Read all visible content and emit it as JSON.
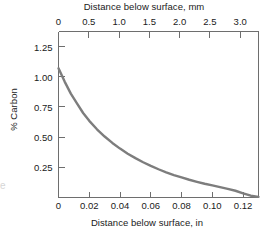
{
  "chart_data": {
    "type": "line",
    "title": "",
    "xlabel": "Distance below surface, in",
    "ylabel": "% Carbon",
    "xlabel_top": "Distance below surface, mm",
    "xlim": [
      0,
      0.13
    ],
    "xlim_top": [
      0,
      3.302
    ],
    "ylim": [
      0,
      1.375
    ],
    "grid": false,
    "legend": null,
    "curve_color": "#7d7d7d",
    "axis_color": "#6e6e6e",
    "xticks_bottom": [
      "0",
      "0.02",
      "0.04",
      "0.06",
      "0.08",
      "0.10",
      "0.12"
    ],
    "xtick_values_bottom": [
      0,
      0.02,
      0.04,
      0.06,
      0.08,
      0.1,
      0.12
    ],
    "xticks_top": [
      "0",
      "0.5",
      "1.0",
      "1.5",
      "2.0",
      "2.5",
      "3.0"
    ],
    "xtick_values_top": [
      0,
      0.5,
      1.0,
      1.5,
      2.0,
      2.5,
      3.0
    ],
    "yticks": [
      "0.25",
      "0.50",
      "0.75",
      "1.00",
      "1.25"
    ],
    "ytick_values": [
      0.25,
      0.5,
      0.75,
      1.0,
      1.25
    ],
    "series": [
      {
        "name": "Carbon concentration profile",
        "x": [
          0,
          0.004,
          0.008,
          0.012,
          0.016,
          0.02,
          0.025,
          0.03,
          0.035,
          0.04,
          0.045,
          0.05,
          0.055,
          0.06,
          0.065,
          0.07,
          0.075,
          0.08,
          0.085,
          0.09,
          0.095,
          0.1,
          0.105,
          0.11,
          0.115,
          0.12,
          0.125,
          0.13
        ],
        "values": [
          1.07,
          0.96,
          0.86,
          0.78,
          0.7,
          0.635,
          0.565,
          0.505,
          0.452,
          0.405,
          0.363,
          0.326,
          0.292,
          0.262,
          0.234,
          0.209,
          0.186,
          0.166,
          0.147,
          0.13,
          0.114,
          0.1,
          0.086,
          0.072,
          0.056,
          0.035,
          0.015,
          0.005
        ]
      }
    ]
  },
  "labels": {
    "top_axis_title": "Distance below surface, mm",
    "bottom_axis_title": "Distance below surface, in",
    "y_axis_title": "% Carbon",
    "ghost_glyph": "e"
  }
}
